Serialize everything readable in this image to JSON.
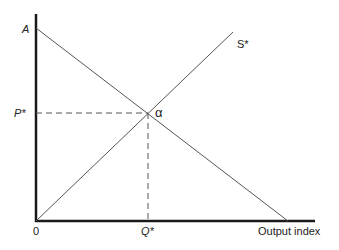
{
  "diagram": {
    "type": "supply-demand-equilibrium",
    "axes": {
      "origin_label": "0",
      "x_label": "Output index",
      "y_label": ""
    },
    "labels": {
      "intercept": "A",
      "supply_curve": "S*",
      "equilibrium_point": "α",
      "equilibrium_price": "P*",
      "equilibrium_quantity": "Q*"
    },
    "curves": [
      {
        "name": "demand",
        "from": "A",
        "direction": "downward-sloping",
        "ends_on": "x-axis"
      },
      {
        "name": "S*",
        "from": "origin",
        "direction": "upward-sloping"
      }
    ],
    "guides": [
      {
        "name": "price-guide",
        "style": "dashed",
        "from": "P*",
        "to": "α"
      },
      {
        "name": "quantity-guide",
        "style": "dashed",
        "from": "α",
        "to": "Q*"
      }
    ],
    "colors": {
      "axis": "#1a1a1a",
      "curve": "#555555",
      "guide": "#555555",
      "text": "#222222"
    }
  }
}
